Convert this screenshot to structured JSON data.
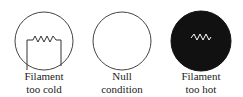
{
  "panels": [
    {
      "name": "filament-too-cold",
      "line1": "Filament",
      "line2": "too cold",
      "fill": "#ffffff",
      "filament_color": "#333333"
    },
    {
      "name": "null-condition",
      "line1": "Null",
      "line2": "condition",
      "fill": "#ffffff"
    },
    {
      "name": "filament-too-hot",
      "line1": "Filament",
      "line2": "too hot",
      "fill": "#111111",
      "filament_color": "#ffffff"
    }
  ]
}
